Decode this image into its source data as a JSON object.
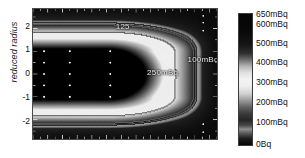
{
  "figure": {
    "type": "contour-heatmap",
    "axis": {
      "y_title": "reduced radius",
      "y_ticks": [
        {
          "label": "2",
          "value": 2
        },
        {
          "label": "1",
          "value": 1
        },
        {
          "label": "0",
          "value": 0
        },
        {
          "label": "-1",
          "value": -1
        },
        {
          "label": "-2",
          "value": -2
        }
      ],
      "x_ticks_labeled": false
    },
    "contour_labels": [
      {
        "text": "125",
        "x_pct": 45,
        "y_pct": 10
      },
      {
        "text": "250mBq",
        "x_pct": 62,
        "y_pct": 45
      },
      {
        "text": "100mBq",
        "x_pct": 84,
        "y_pct": 35
      }
    ],
    "colorbar": {
      "unit_low": "0Bq",
      "ticks": [
        {
          "label": "650mBq",
          "pos_pct": 0
        },
        {
          "label": "600mBq",
          "pos_pct": 7
        },
        {
          "label": "500mBq",
          "pos_pct": 22
        },
        {
          "label": "400mBq",
          "pos_pct": 37
        },
        {
          "label": "300mBq",
          "pos_pct": 52
        },
        {
          "label": "200mBq",
          "pos_pct": 67
        },
        {
          "label": "100mBq",
          "pos_pct": 82
        },
        {
          "label": "0Bq",
          "pos_pct": 97
        }
      ]
    },
    "colors": {
      "background": "#ffffff",
      "text": "#111111",
      "contour_label": "#e8e8e8",
      "marker": "#f4f4f4",
      "frame": "#4a4a4a"
    }
  },
  "chart_data": {
    "type": "heatmap",
    "title": "",
    "xlabel": "",
    "ylabel": "reduced radius",
    "ylim": [
      -2.85,
      2.85
    ],
    "xlim": [
      0,
      1
    ],
    "grid": false,
    "legend": "colorbar-right",
    "colormap": "grayscale-cyclic",
    "zlim_labels": [
      "0Bq",
      "650mBq"
    ],
    "colorbar_ticks": [
      "650mBq",
      "600mBq",
      "500mBq",
      "400mBq",
      "300mBq",
      "200mBq",
      "100mBq",
      "0Bq"
    ],
    "contour_levels": [
      {
        "label": "125",
        "value": 125,
        "unit": "mBq"
      },
      {
        "label": "250mBq",
        "value": 250,
        "unit": "mBq"
      },
      {
        "label": "100mBq",
        "value": 100,
        "unit": "mBq"
      }
    ],
    "y_ticks": [
      2,
      1,
      0,
      -1,
      -2
    ]
  }
}
